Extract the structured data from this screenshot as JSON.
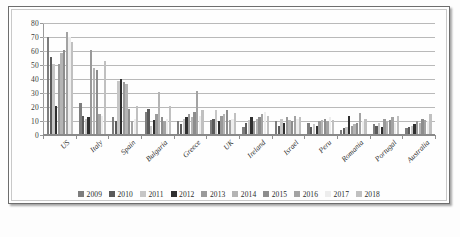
{
  "chart_data": {
    "type": "bar",
    "title": "",
    "xlabel": "",
    "ylabel": "",
    "ylim": [
      0,
      80
    ],
    "yticks": [
      0,
      10,
      20,
      30,
      40,
      50,
      60,
      70,
      80
    ],
    "grid": true,
    "legend_position": "bottom",
    "categories": [
      "US",
      "Italy",
      "Spain",
      "Bulgaria",
      "Greece",
      "UK",
      "Ireland",
      "Israel",
      "Peru",
      "Romania",
      "Portugal",
      "Australia"
    ],
    "series": [
      {
        "name": "2009",
        "color": "#7d7d7d",
        "values": [
          69,
          22,
          12,
          16,
          9,
          10,
          5,
          9,
          8,
          3,
          7,
          4
        ]
      },
      {
        "name": "2010",
        "color": "#5a5a5a",
        "values": [
          55,
          13,
          9,
          18,
          7,
          11,
          8,
          6,
          5,
          4,
          6,
          5
        ]
      },
      {
        "name": "2011",
        "color": "#c6c6c6",
        "values": [
          50,
          11,
          38,
          6,
          11,
          17,
          10,
          11,
          7,
          5,
          8,
          6
        ]
      },
      {
        "name": "2012",
        "color": "#2f2f2f",
        "values": [
          20,
          12,
          39,
          10,
          12,
          9,
          12,
          8,
          6,
          13,
          5,
          7
        ]
      },
      {
        "name": "2013",
        "color": "#9a9a9a",
        "values": [
          50,
          60,
          37,
          14,
          14,
          13,
          9,
          12,
          9,
          6,
          11,
          9
        ]
      },
      {
        "name": "2014",
        "color": "#b4b4b4",
        "values": [
          58,
          47,
          36,
          30,
          12,
          14,
          11,
          10,
          10,
          7,
          9,
          8
        ]
      },
      {
        "name": "2015",
        "color": "#8d8d8d",
        "values": [
          60,
          46,
          18,
          12,
          16,
          17,
          12,
          9,
          11,
          8,
          10,
          11
        ]
      },
      {
        "name": "2016",
        "color": "#a3a3a3",
        "values": [
          73,
          14,
          9,
          9,
          31,
          10,
          14,
          13,
          9,
          15,
          12,
          10
        ]
      },
      {
        "name": "2017",
        "color": "#ededed",
        "values": [
          69,
          13,
          11,
          11,
          13,
          11,
          16,
          11,
          12,
          9,
          8,
          9
        ]
      },
      {
        "name": "2018",
        "color": "#c0c0c0",
        "values": [
          66,
          52,
          20,
          20,
          17,
          15,
          13,
          12,
          10,
          11,
          13,
          14
        ]
      }
    ]
  }
}
